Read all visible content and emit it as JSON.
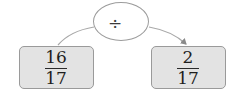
{
  "diagram": {
    "type": "operation-flow",
    "operator": {
      "symbol": "÷",
      "name": "division"
    },
    "input": {
      "numerator": "16",
      "denominator": "17"
    },
    "output": {
      "numerator": "2",
      "denominator": "17"
    },
    "colors": {
      "box_fill": "#e3e3e3",
      "box_border": "#9a9a9a",
      "line": "#9c9c9c",
      "text": "#1e1e1e"
    }
  }
}
